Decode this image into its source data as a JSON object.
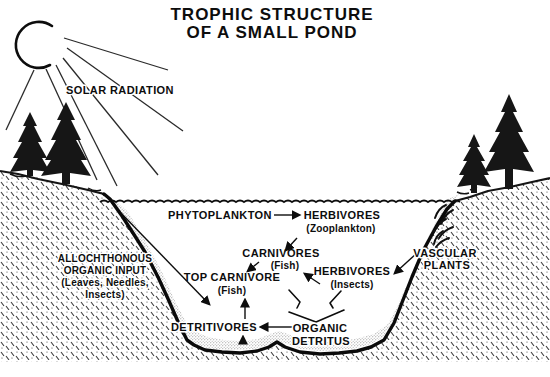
{
  "title": {
    "line1": "TROPHIC STRUCTURE",
    "line2": "OF A SMALL POND"
  },
  "labels": {
    "solar_radiation": "SOLAR RADIATION",
    "phytoplankton": "PHYTOPLANKTON",
    "herbivores_zooplankton": {
      "name": "HERBIVORES",
      "detail": "(Zooplankton)"
    },
    "carnivores_fish": {
      "name": "CARNIVORES",
      "detail": "(Fish)"
    },
    "top_carnivore_fish": {
      "name": "TOP CARNIVORE",
      "detail": "(Fish)"
    },
    "herbivores_insects": {
      "name": "HERBIVORES",
      "detail": "(Insects)"
    },
    "vascular_plants": {
      "line1": "VASCULAR",
      "line2": "PLANTS"
    },
    "allochthonous": {
      "line1": "ALLOCHTHONOUS",
      "line2": "ORGANIC INPUT",
      "line3": "(Leaves, Needles,",
      "line4": "Insects)"
    },
    "detritivores": "DETRITIVORES",
    "organic_detritus": {
      "line1": "ORGANIC",
      "line2": "DETRITUS"
    }
  },
  "colors": {
    "ink": "#0d0d0d",
    "background": "#ffffff"
  }
}
